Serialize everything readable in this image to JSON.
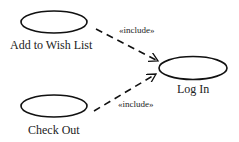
{
  "diagram": {
    "type": "uml-use-case",
    "use_cases": [
      {
        "id": "wish",
        "label": "Add to Wish List"
      },
      {
        "id": "login",
        "label": "Log In"
      },
      {
        "id": "checkout",
        "label": "Check Out"
      }
    ],
    "relationships": [
      {
        "from": "wish",
        "to": "login",
        "stereotype": "«include»"
      },
      {
        "from": "checkout",
        "to": "login",
        "stereotype": "«include»"
      }
    ],
    "colors": {
      "stroke": "#111111",
      "background": "#ffffff"
    }
  }
}
